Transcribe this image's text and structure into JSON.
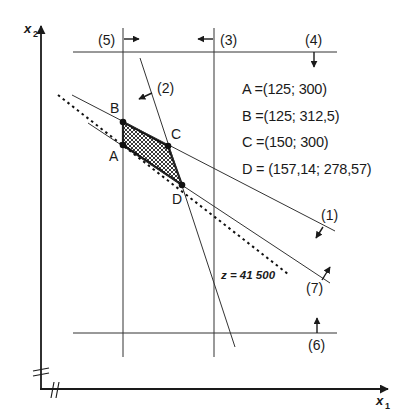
{
  "diagram": {
    "type": "linear-programming-graphical-solution",
    "axes": {
      "x_label": "x₁",
      "x_label_base": "x",
      "x_label_sub": "1",
      "y_label_base": "x",
      "y_label_sub": "2",
      "axis_break": true
    },
    "constraints": [
      {
        "id": "1",
        "label": "(1)",
        "orientation": "descending",
        "feasible_side": "below-left"
      },
      {
        "id": "2",
        "label": "(2)",
        "orientation": "steep-descending",
        "feasible_side": "left"
      },
      {
        "id": "3",
        "label": "(3)",
        "orientation": "vertical",
        "feasible_side": "left"
      },
      {
        "id": "4",
        "label": "(4)",
        "orientation": "horizontal",
        "feasible_side": "below"
      },
      {
        "id": "5",
        "label": "(5)",
        "orientation": "vertical",
        "feasible_side": "right"
      },
      {
        "id": "6",
        "label": "(6)",
        "orientation": "horizontal",
        "feasible_side": "above"
      },
      {
        "id": "7",
        "label": "(7)",
        "orientation": "descending",
        "feasible_side": "above-right"
      }
    ],
    "objective_line": {
      "label": "z = 41 500",
      "style": "dashed"
    },
    "feasible_region": {
      "vertices": [
        "A",
        "B",
        "C",
        "D"
      ],
      "fill": "cross-hatched"
    },
    "points": [
      {
        "name": "A",
        "label": "A",
        "coords_text": "A =(125; 300)",
        "x1": 125,
        "x2": 300
      },
      {
        "name": "B",
        "label": "B",
        "coords_text": "B =(125; 312,5)",
        "x1": 125,
        "x2": 312.5
      },
      {
        "name": "C",
        "label": "C",
        "coords_text": "C =(150; 300)",
        "x1": 150,
        "x2": 300
      },
      {
        "name": "D",
        "label": "D",
        "coords_text": "D = (157,14; 278,57)",
        "x1": 157.14,
        "x2": 278.57
      }
    ],
    "colors": {
      "ink": "#1a1a1a",
      "background": "#ffffff"
    }
  }
}
